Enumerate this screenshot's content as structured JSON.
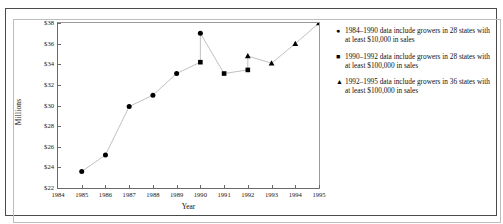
{
  "chart_data": {
    "type": "line",
    "title": "",
    "xlabel": "Year",
    "ylabel": "Millions",
    "xlim": [
      1984,
      1995
    ],
    "ylim": [
      22,
      38
    ],
    "ytick_labels": [
      "$22",
      "$24",
      "$26",
      "$28",
      "$30",
      "$32",
      "$34",
      "$36",
      "$38"
    ],
    "ytick_values": [
      22,
      24,
      26,
      28,
      30,
      32,
      34,
      36,
      38
    ],
    "xtick_labels": [
      "1984",
      "1985",
      "1986",
      "1987",
      "1988",
      "1989",
      "1990",
      "1991",
      "1992",
      "1993",
      "1994",
      "1995"
    ],
    "xtick_values": [
      1984,
      1985,
      1986,
      1987,
      1988,
      1989,
      1990,
      1991,
      1992,
      1993,
      1994,
      1995
    ],
    "grid": false,
    "legend_position": "right",
    "series": [
      {
        "name": "1984–1990 data include growers in 28 states with at least $10,000 in sales",
        "marker": "circle",
        "x": [
          1985,
          1986,
          1987,
          1988,
          1989,
          1990
        ],
        "values": [
          23.6,
          25.2,
          29.9,
          31.0,
          33.1,
          37.0
        ]
      },
      {
        "name": "1990–1992 data include growers in 28 states with at least $100,000 in sales",
        "marker": "square",
        "x": [
          1990,
          1991,
          1992
        ],
        "values": [
          34.2,
          33.1,
          33.45
        ]
      },
      {
        "name": "1992–1995 data include growers in 36 states with at least $100,000 in sales",
        "marker": "triangle",
        "x": [
          1992,
          1993,
          1994,
          1995
        ],
        "values": [
          34.8,
          34.1,
          36.0,
          38.0
        ]
      }
    ],
    "line_color": "#b9b9b9",
    "marker_color": "#000000",
    "axis_color": "#6a6a6a"
  },
  "legend": {
    "entries": [
      {
        "marker": "●",
        "text": "1984–1990 data include growers in 28 states with at least $10,000 in sales"
      },
      {
        "marker": "■",
        "text": "1990–1992 data include growers in 28 states with at least $100,000 in sales"
      },
      {
        "marker": "▲",
        "text": "1992–1995 data include growers in 36 states with at least $100,000 in sales"
      }
    ]
  }
}
